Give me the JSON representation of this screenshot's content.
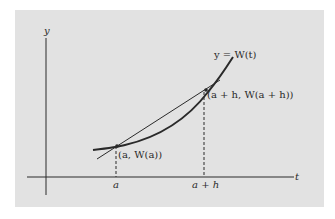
{
  "figure": {
    "background_color": "#e2e2e2",
    "ink_color": "#2a2a2a",
    "axes": {
      "x_label": "t",
      "y_label": "y"
    },
    "curve_label": "y = W(t)",
    "point_a_label": "(a, W(a))",
    "point_ah_label": "(a + h, W(a + h))",
    "tick_a_label": "a",
    "tick_ah_label": "a + h"
  }
}
